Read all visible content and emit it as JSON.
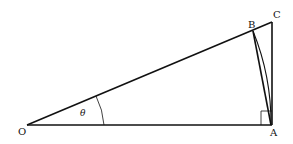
{
  "diagram": {
    "type": "geometry",
    "colors": {
      "stroke": "#111111",
      "background": "#ffffff"
    },
    "points": {
      "O": {
        "label": "O",
        "x": 27,
        "y": 125
      },
      "A": {
        "label": "A",
        "x": 271,
        "y": 125
      },
      "B": {
        "label": "B",
        "x": 253,
        "y": 31
      },
      "C": {
        "label": "C",
        "x": 272,
        "y": 22
      }
    },
    "angle": {
      "label": "θ",
      "vertex": "O"
    },
    "right_angle_marker": {
      "vertex": "A"
    },
    "segments": [
      "OA",
      "OC",
      "CA",
      "BA"
    ],
    "arcs": [
      "BA (centered at O)",
      "angle arc at O"
    ]
  }
}
